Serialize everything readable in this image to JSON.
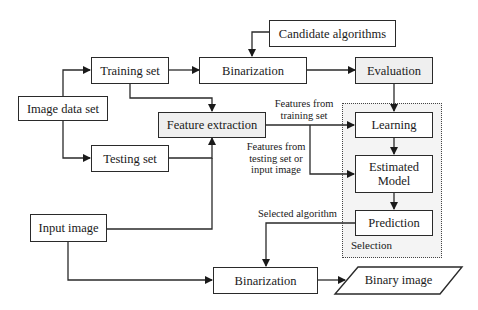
{
  "diagram": {
    "type": "flowchart",
    "nodes": {
      "candidate_algorithms": "Candidate algorithms",
      "binarization_top": "Binarization",
      "evaluation": "Evaluation",
      "training_set": "Training set",
      "image_data_set": "Image data set",
      "feature_extraction": "Feature extraction",
      "testing_set": "Testing set",
      "learning": "Learning",
      "estimated_model": "Estimated Model",
      "prediction": "Prediction",
      "input_image": "Input image",
      "binarization_bottom": "Binarization",
      "binary_image": "Binary image"
    },
    "group": {
      "selection_label": "Selection"
    },
    "edge_labels": {
      "features_training": "Features from training set",
      "features_training_l1": "Features from",
      "features_training_l2": "training set",
      "features_testing_l1": "Features from",
      "features_testing_l2": "testing set or",
      "features_testing_l3": "input image",
      "selected_algorithm": "Selected algorithm"
    },
    "edges": [
      [
        "Image data set",
        "Training set"
      ],
      [
        "Image data set",
        "Testing set"
      ],
      [
        "Training set",
        "Binarization"
      ],
      [
        "Training set",
        "Feature extraction"
      ],
      [
        "Testing set",
        "Feature extraction"
      ],
      [
        "Input image",
        "Feature extraction"
      ],
      [
        "Candidate algorithms",
        "Binarization"
      ],
      [
        "Binarization",
        "Evaluation"
      ],
      [
        "Evaluation",
        "Learning"
      ],
      [
        "Feature extraction",
        "Learning"
      ],
      [
        "Feature extraction",
        "Estimated Model"
      ],
      [
        "Learning",
        "Estimated Model"
      ],
      [
        "Estimated Model",
        "Prediction"
      ],
      [
        "Prediction",
        "Binarization (bottom)"
      ],
      [
        "Input image",
        "Binarization (bottom)"
      ],
      [
        "Binarization (bottom)",
        "Binary image"
      ]
    ],
    "colors": {
      "line": "#2a2a2a",
      "shaded_fill": "#efefef",
      "selection_fill": "#f4f4f4"
    }
  }
}
